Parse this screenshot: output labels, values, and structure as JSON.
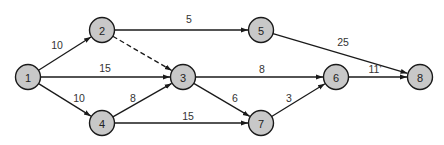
{
  "diagram": {
    "type": "network-activity-diagram",
    "nodes": [
      {
        "id": "1",
        "label": "1",
        "x": 28,
        "y": 77
      },
      {
        "id": "2",
        "label": "2",
        "x": 102,
        "y": 30
      },
      {
        "id": "3",
        "label": "3",
        "x": 183,
        "y": 77
      },
      {
        "id": "4",
        "label": "4",
        "x": 102,
        "y": 123
      },
      {
        "id": "5",
        "label": "5",
        "x": 261,
        "y": 30
      },
      {
        "id": "6",
        "label": "6",
        "x": 336,
        "y": 77
      },
      {
        "id": "7",
        "label": "7",
        "x": 261,
        "y": 123
      },
      {
        "id": "8",
        "label": "8",
        "x": 420,
        "y": 77
      }
    ],
    "edges": [
      {
        "from": "1",
        "to": "2",
        "label": "10",
        "dashed": false,
        "lx": 57,
        "ly": 49
      },
      {
        "from": "1",
        "to": "3",
        "label": "15",
        "dashed": false,
        "lx": 105,
        "ly": 72
      },
      {
        "from": "1",
        "to": "4",
        "label": "10",
        "dashed": false,
        "lx": 79,
        "ly": 102
      },
      {
        "from": "2",
        "to": "5",
        "label": "5",
        "dashed": false,
        "lx": 189,
        "ly": 23
      },
      {
        "from": "2",
        "to": "3",
        "label": "",
        "dashed": true,
        "lx": 0,
        "ly": 0
      },
      {
        "from": "4",
        "to": "3",
        "label": "8",
        "dashed": false,
        "lx": 133,
        "ly": 102
      },
      {
        "from": "4",
        "to": "7",
        "label": "15",
        "dashed": false,
        "lx": 188,
        "ly": 120
      },
      {
        "from": "3",
        "to": "6",
        "label": "8",
        "dashed": false,
        "lx": 262,
        "ly": 73
      },
      {
        "from": "3",
        "to": "7",
        "label": "6",
        "dashed": false,
        "lx": 235,
        "ly": 102
      },
      {
        "from": "7",
        "to": "6",
        "label": "3",
        "dashed": false,
        "lx": 289,
        "ly": 102
      },
      {
        "from": "5",
        "to": "8",
        "label": "25",
        "dashed": false,
        "lx": 343,
        "ly": 46
      },
      {
        "from": "6",
        "to": "8",
        "label": "11'",
        "dashed": false,
        "lx": 375,
        "ly": 73
      }
    ],
    "colors": {
      "node_fill": "#c8c8c8",
      "stroke": "#1a1a1a"
    }
  }
}
